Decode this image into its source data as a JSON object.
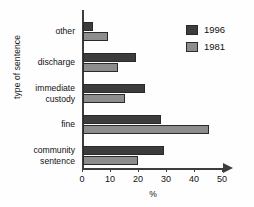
{
  "chart_data": {
    "type": "bar",
    "orientation": "horizontal",
    "title": "",
    "xlabel": "%",
    "ylabel": "type of sentence",
    "categories": [
      "other",
      "discharge",
      "immediate\ncustody",
      "fine",
      "community\nsentence"
    ],
    "series": [
      {
        "name": "1996",
        "color": "#3c3c3c",
        "values": [
          3.5,
          19,
          22,
          28,
          29
        ]
      },
      {
        "name": "1981",
        "color": "#8d8d8d",
        "values": [
          9,
          12.5,
          15,
          45,
          19.5
        ]
      }
    ],
    "xlim": [
      0,
      50
    ],
    "xticks": [
      0,
      10,
      20,
      30,
      40,
      50
    ],
    "xtick_labels": [
      "0",
      "10",
      "20",
      "30",
      "40",
      "50"
    ],
    "grid": false,
    "legend_position": "top-right"
  },
  "axis": {
    "y_title": "type of sentence",
    "x_title": "%"
  },
  "legend": {
    "entries": [
      {
        "label": "1996",
        "color": "#3c3c3c"
      },
      {
        "label": "1981",
        "color": "#8d8d8d"
      }
    ]
  }
}
